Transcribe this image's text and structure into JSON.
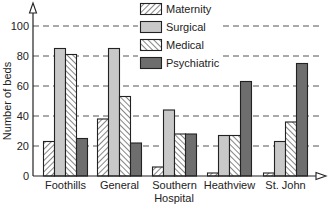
{
  "chart_data": {
    "type": "bar",
    "title": "",
    "xlabel": "Hospital",
    "ylabel": "Number of beds",
    "ylim": [
      0,
      100
    ],
    "yticks": [
      0,
      20,
      40,
      60,
      80,
      100
    ],
    "grid": {
      "y": true,
      "style": "dashed"
    },
    "legend_position": "top-center",
    "categories": [
      "Foothills",
      "General",
      "Southern",
      "Heathview",
      "St. John"
    ],
    "series": [
      {
        "name": "Maternity",
        "values": [
          23,
          38,
          6,
          2,
          2
        ],
        "pattern": "hatch-forward",
        "color": "#ffffff"
      },
      {
        "name": "Surgical",
        "values": [
          85,
          85,
          44,
          27,
          23
        ],
        "pattern": "solid",
        "color": "#c8c8c8"
      },
      {
        "name": "Medical",
        "values": [
          81,
          53,
          28,
          27,
          36
        ],
        "pattern": "hatch-back",
        "color": "#ffffff"
      },
      {
        "name": "Psychiatric",
        "values": [
          25,
          22,
          28,
          63,
          75
        ],
        "pattern": "solid",
        "color": "#6e6e6e"
      }
    ]
  },
  "colors": {
    "axis": "#222222",
    "grid": "#555555",
    "bar_outline": "#222222",
    "hatch": "#444444"
  }
}
